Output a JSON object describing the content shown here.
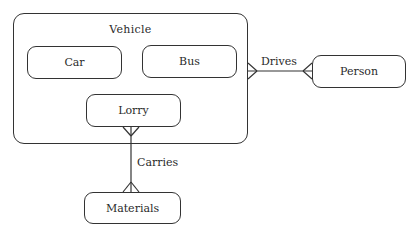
{
  "diagram": {
    "type": "entity-relationship",
    "container": {
      "name": "Vehicle"
    },
    "entities": {
      "car": "Car",
      "bus": "Bus",
      "lorry": "Lorry",
      "person": "Person",
      "materials": "Materials"
    },
    "relationships": [
      {
        "label": "Drives",
        "from": "Vehicle",
        "to": "Person",
        "from_cardinality": "many",
        "to_cardinality": "many"
      },
      {
        "label": "Carries",
        "from": "Lorry",
        "to": "Materials",
        "from_cardinality": "many",
        "to_cardinality": "many"
      }
    ],
    "colors": {
      "line": "#333333",
      "text": "#2a2a2a",
      "background": "#ffffff"
    }
  }
}
